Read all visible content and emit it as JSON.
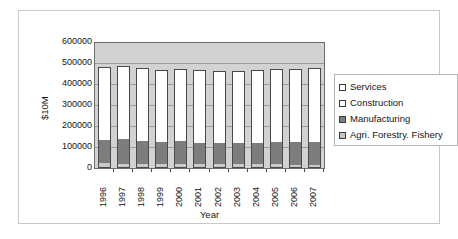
{
  "chart_data": {
    "type": "bar",
    "subtype": "stacked-column",
    "title": "",
    "xlabel": "Year",
    "ylabel": "$10M",
    "ylim": [
      0,
      600000
    ],
    "ytick_labels": [
      "600000",
      "500000",
      "400000",
      "300000",
      "200000",
      "100000",
      "0"
    ],
    "ytick_values": [
      600000,
      500000,
      400000,
      300000,
      200000,
      100000,
      0
    ],
    "grid": true,
    "legend_position": "right",
    "categories": [
      "1996",
      "1997",
      "1998",
      "1999",
      "2000",
      "2001",
      "2002",
      "2003",
      "2004",
      "2005",
      "2006",
      "2007"
    ],
    "series": [
      {
        "name": "Agri. Forestry. Fishery",
        "color": "#c4c4c4",
        "values": [
          22000,
          21000,
          21000,
          20000,
          19000,
          18000,
          17000,
          17000,
          17000,
          17000,
          16000,
          16000
        ]
      },
      {
        "name": "Manufacturing",
        "color": "#7d7d7d",
        "values": [
          113000,
          116000,
          110000,
          107000,
          109000,
          103000,
          103000,
          104000,
          105000,
          108000,
          108000,
          107000
        ]
      },
      {
        "name": "Construction",
        "color": "#ffffff",
        "values": [
          40000,
          39000,
          37000,
          34000,
          34000,
          30000,
          29000,
          26000,
          26000,
          25000,
          25000,
          25000
        ]
      },
      {
        "name": "Services",
        "color": "#ffffff",
        "values": [
          310000,
          315000,
          313000,
          311000,
          315000,
          318000,
          318000,
          320000,
          322000,
          323000,
          326000,
          332000
        ]
      }
    ],
    "totals": [
      485000,
      491000,
      481000,
      472000,
      477000,
      469000,
      467000,
      467000,
      470000,
      473000,
      475000,
      480000
    ]
  },
  "legend": {
    "items": [
      {
        "label": "Services",
        "swatch": "legend-swatch-services"
      },
      {
        "label": "Construction",
        "swatch": "legend-swatch-construction"
      },
      {
        "label": "Manufacturing",
        "swatch": "legend-swatch-manufacturing"
      },
      {
        "label": "Agri. Forestry. Fishery",
        "swatch": "legend-swatch-agriculture"
      }
    ]
  },
  "colors": {
    "plot_background": "#d2d2d2",
    "gridline": "#9a9a9a",
    "axis_line": "#6e6e6e",
    "bar_outline": "#4a4a4a",
    "frame_border": "#c8c8c8",
    "text": "#161616"
  }
}
